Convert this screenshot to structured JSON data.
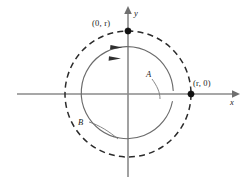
{
  "figure": {
    "background_color": "#ffffff",
    "axes": {
      "x_label": "x",
      "y_label": "y",
      "x_axis_color": "#8a8a8a",
      "y_axis_color": "#8a8a8a",
      "origin": {
        "x": 128,
        "y": 94
      }
    },
    "points": [
      {
        "name": "top-point",
        "label": "(0, r)",
        "x": 128,
        "y": 31
      },
      {
        "name": "right-point",
        "label": "(r, 0)",
        "x": 191,
        "y": 94
      }
    ],
    "curves": [
      {
        "name": "outer-path",
        "label": "B",
        "style": "dashed",
        "radius": 63,
        "stroke_color": "#2b2b2b",
        "direction": "counterclockwise"
      },
      {
        "name": "inner-path",
        "label": "A",
        "style": "solid",
        "radius": 46,
        "stroke_color": "#6b6b6b",
        "direction": "counterclockwise"
      }
    ],
    "direction_arrows": [
      {
        "name": "outer-direction-arrow",
        "points_toward": "right"
      },
      {
        "name": "inner-direction-arrow",
        "points_toward": "right"
      }
    ]
  }
}
